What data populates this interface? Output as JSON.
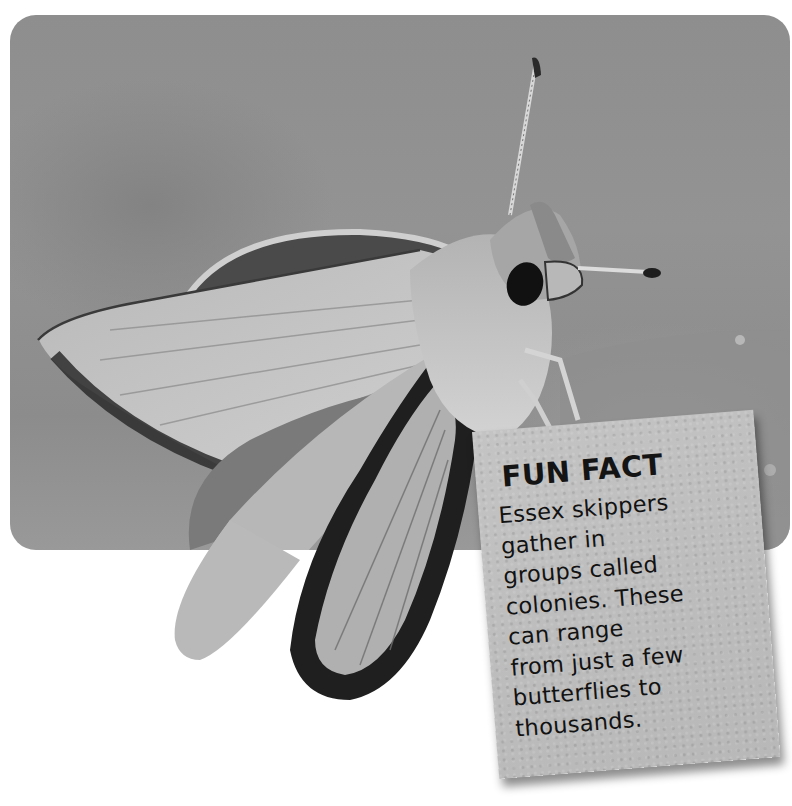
{
  "image": {
    "subject": "Essex skipper butterfly",
    "style": "grayscale photograph in rounded frame"
  },
  "fun_fact": {
    "title": "FUN FACT",
    "lines": [
      "Essex skippers",
      "gather in",
      "groups called",
      "colonies. These",
      "can range",
      "from just a few",
      "butterflies to",
      "thousands."
    ]
  },
  "colors": {
    "background": "#ffffff",
    "photo_gray": "#8e8e8e",
    "card_gray": "#bfbfbf",
    "text": "#121212"
  }
}
